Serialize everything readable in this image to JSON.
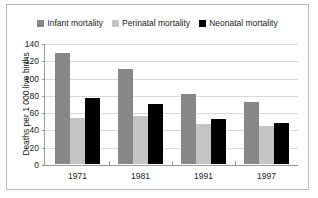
{
  "chart_data": {
    "type": "bar",
    "title": "",
    "subtitle": "",
    "xlabel": "",
    "ylabel": "Deaths per 1 000 live births",
    "categories": [
      "1971",
      "1981",
      "1991",
      "1997"
    ],
    "series": [
      {
        "name": "Infant mortality",
        "color": "#878787",
        "values": [
          129,
          110,
          81,
          72
        ]
      },
      {
        "name": "Perinatal mortality",
        "color": "#c4c4c4",
        "values": [
          53,
          55,
          46,
          44
        ]
      },
      {
        "name": "Neonatal mortality",
        "color": "#000000",
        "values": [
          76,
          70,
          52,
          47
        ]
      }
    ],
    "ylim": [
      0,
      140
    ],
    "yticks": [
      0,
      20,
      40,
      60,
      80,
      100,
      120,
      140
    ],
    "ytick_labels": [
      "0",
      "20",
      "40",
      "60",
      "80",
      "100",
      "120",
      "140"
    ],
    "grid": true,
    "legend_position": "top-center"
  },
  "legend": {
    "entries": [
      {
        "label": "Infant mortality",
        "swatch": "#878787"
      },
      {
        "label": "Perinatal mortality",
        "swatch": "#c4c4c4"
      },
      {
        "label": "Neonatal mortality",
        "swatch": "#000000"
      }
    ]
  },
  "axes": {
    "y_title": "Deaths per 1 000 live births"
  },
  "colors": {
    "frame": "#b9b9b9",
    "axis": "#9a9a9a",
    "gridline": "#d8d8d8",
    "text": "#1a1a1a",
    "background": "#ffffff"
  }
}
